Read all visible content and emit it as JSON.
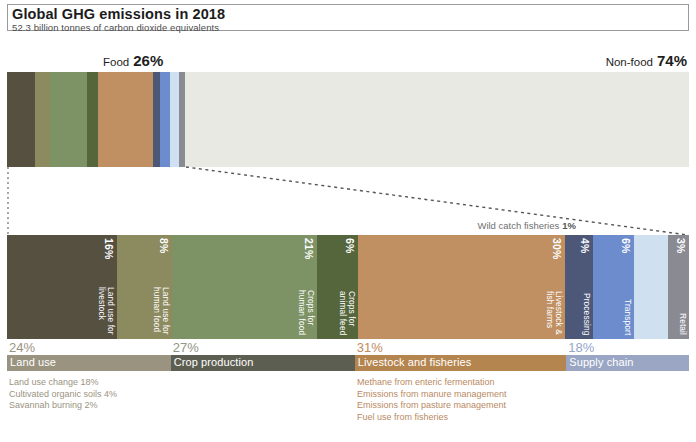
{
  "header": {
    "title": "Global GHG emissions in 2018",
    "subtitle": "52.3 billion tonnes of carbon dioxide equivalents"
  },
  "top_bar": {
    "food_label": "Food",
    "food_pct": "26%",
    "nonfood_label": "Non-food",
    "nonfood_pct": "74%"
  },
  "callout": {
    "wild_catch_label": "Wild catch fisheries",
    "wild_catch_pct": "1%"
  },
  "detail_segments": [
    {
      "name": "Land use for\nlivestock",
      "pct": "16%",
      "value": 16,
      "color": "#55503f",
      "label_color": "#ffffff"
    },
    {
      "name": "Land use for\nhuman food",
      "pct": "8%",
      "value": 8,
      "color": "#8c8a5f",
      "label_color": "#ffffff"
    },
    {
      "name": "Crops for\nhuman food",
      "pct": "21%",
      "value": 21,
      "color": "#7d9265",
      "label_color": "#ffffff"
    },
    {
      "name": "Crops for\nanimal feed",
      "pct": "6%",
      "value": 6,
      "color": "#55663c",
      "label_color": "#ffffff"
    },
    {
      "name": "Livestock &\nfish farms",
      "pct": "30%",
      "value": 30,
      "color": "#c08f62",
      "label_color": "#ffffff"
    },
    {
      "name": "Processing",
      "pct": "4%",
      "value": 4,
      "color": "#4d5778",
      "label_color": "#ffffff"
    },
    {
      "name": "Transport",
      "pct": "6%",
      "value": 6,
      "color": "#6d8ccd",
      "label_color": "#ffffff"
    },
    {
      "name": "",
      "pct": "",
      "value": 5,
      "color": "#cfe0f0",
      "label_color": "#ffffff"
    },
    {
      "name": "Retail",
      "pct": "3%",
      "value": 3,
      "color": "#8a8a93",
      "label_color": "#ffffff"
    }
  ],
  "top_bar_segments": [
    {
      "name": "land-use-livestock",
      "value": 16,
      "color": "#55503f"
    },
    {
      "name": "land-use-human-food",
      "value": 8,
      "color": "#8c8a5f"
    },
    {
      "name": "crops-human-food",
      "value": 21,
      "color": "#7d9265"
    },
    {
      "name": "crops-animal-feed",
      "value": 6,
      "color": "#55663c"
    },
    {
      "name": "livestock-fish",
      "value": 31,
      "color": "#c08f62"
    },
    {
      "name": "processing",
      "value": 4,
      "color": "#4d5778"
    },
    {
      "name": "transport",
      "value": 6,
      "color": "#6d8ccd"
    },
    {
      "name": "packaging",
      "value": 5,
      "color": "#cfe0f0"
    },
    {
      "name": "retail",
      "value": 3,
      "color": "#8a8a93"
    },
    {
      "name": "non-food",
      "value": 284,
      "color": "#e8e9e3"
    }
  ],
  "legend": [
    {
      "pct": "24%",
      "name": "Land use",
      "value": 24,
      "color": "#9a937f"
    },
    {
      "pct": "27%",
      "name": "Crop production",
      "value": 27,
      "color": "#5d5e52"
    },
    {
      "pct": "31%",
      "name": "Livestock and fisheries",
      "value": 31,
      "color": "#b5854f"
    },
    {
      "pct": "18%",
      "name": "Supply chain",
      "value": 18,
      "color": "#9aa6c4"
    }
  ],
  "sub_land_use": [
    "Land use change  18%",
    "Cultivated organic soils  4%",
    "Savannah burning  2%"
  ],
  "sub_livestock": [
    "Methane from enteric fermentation",
    "Emissions from manure management",
    "Emissions from pasture management",
    "Fuel use from fisheries"
  ]
}
